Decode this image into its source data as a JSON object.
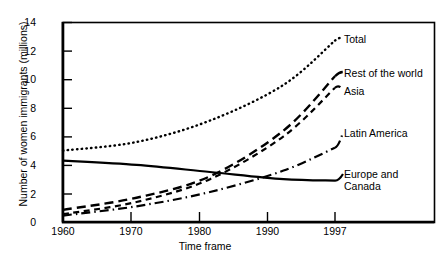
{
  "chart_data": {
    "type": "line",
    "title": "",
    "xlabel": "Time frame",
    "ylabel": "Number of women immigrants (millions)",
    "xlim": [
      1960,
      1997
    ],
    "ylim": [
      0,
      14
    ],
    "xticks": [
      "1960",
      "1970",
      "1980",
      "1990",
      "1997"
    ],
    "xtick_values": [
      1960,
      1970,
      1980,
      1990,
      1997
    ],
    "yticks": [
      "0",
      "2",
      "4",
      "6",
      "8",
      "10",
      "12",
      "14"
    ],
    "ytick_values": [
      0,
      2,
      4,
      6,
      8,
      10,
      12,
      14
    ],
    "grid": false,
    "legend_position": "right-inline-labels",
    "x": [
      1960,
      1970,
      1980,
      1990,
      1997
    ],
    "series": [
      {
        "name": "Total",
        "label": "Total",
        "style": "dotted",
        "color": "#000000",
        "values": [
          5.0,
          5.6,
          7.1,
          9.6,
          12.7
        ]
      },
      {
        "name": "Rest of the world",
        "label": "Rest of the world",
        "style": "dashed",
        "color": "#000000",
        "values": [
          0.85,
          1.7,
          3.2,
          6.4,
          10.2
        ]
      },
      {
        "name": "Asia",
        "label": "Asia",
        "style": "dashed-short",
        "color": "#000000",
        "values": [
          0.55,
          1.4,
          3.0,
          6.0,
          9.4
        ]
      },
      {
        "name": "Latin America",
        "label": "Latin America",
        "style": "dash-dot",
        "color": "#000000",
        "values": [
          0.45,
          1.1,
          2.1,
          3.6,
          5.2
        ]
      },
      {
        "name": "Europe and Canada",
        "label": "Europe and\nCanada",
        "style": "solid",
        "color": "#000000",
        "values": [
          4.3,
          4.0,
          3.5,
          3.0,
          2.9
        ]
      }
    ]
  }
}
